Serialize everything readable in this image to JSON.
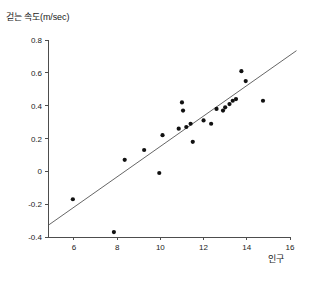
{
  "chart_data": {
    "type": "scatter",
    "title": "",
    "ylabel": "걷는 속도(m/sec)",
    "xlabel": "인구",
    "xlim": [
      4.8,
      16.0
    ],
    "ylim": [
      -0.4,
      0.8
    ],
    "xticks": [
      6,
      8,
      10,
      12,
      14,
      16
    ],
    "xtick_labels": [
      "6",
      "8",
      "10",
      "12",
      "14",
      "16"
    ],
    "yticks": [
      -0.4,
      -0.2,
      0,
      0.2,
      0.4,
      0.6,
      0.8
    ],
    "ytick_labels": [
      "-0.4",
      "-0.2",
      "0",
      "0.2",
      "0.4",
      "0.6",
      "0.8"
    ],
    "grid": false,
    "legend": false,
    "marker_color": "#111111",
    "trendline_color": "#555555",
    "points": [
      {
        "x": 5.95,
        "y": -0.17
      },
      {
        "x": 7.85,
        "y": -0.37
      },
      {
        "x": 8.35,
        "y": 0.07
      },
      {
        "x": 9.25,
        "y": 0.13
      },
      {
        "x": 9.95,
        "y": -0.01
      },
      {
        "x": 10.1,
        "y": 0.22
      },
      {
        "x": 10.85,
        "y": 0.26
      },
      {
        "x": 11.0,
        "y": 0.42
      },
      {
        "x": 11.05,
        "y": 0.37
      },
      {
        "x": 11.2,
        "y": 0.27
      },
      {
        "x": 11.4,
        "y": 0.29
      },
      {
        "x": 11.5,
        "y": 0.18
      },
      {
        "x": 12.0,
        "y": 0.31
      },
      {
        "x": 12.35,
        "y": 0.29
      },
      {
        "x": 12.6,
        "y": 0.38
      },
      {
        "x": 12.9,
        "y": 0.37
      },
      {
        "x": 13.0,
        "y": 0.39
      },
      {
        "x": 13.2,
        "y": 0.41
      },
      {
        "x": 13.35,
        "y": 0.43
      },
      {
        "x": 13.5,
        "y": 0.44
      },
      {
        "x": 13.75,
        "y": 0.61
      },
      {
        "x": 13.95,
        "y": 0.55
      },
      {
        "x": 14.75,
        "y": 0.43
      }
    ],
    "trendline": {
      "x_start": 4.85,
      "y_start": -0.325,
      "x_end": 16.3,
      "y_end": 0.735
    }
  }
}
